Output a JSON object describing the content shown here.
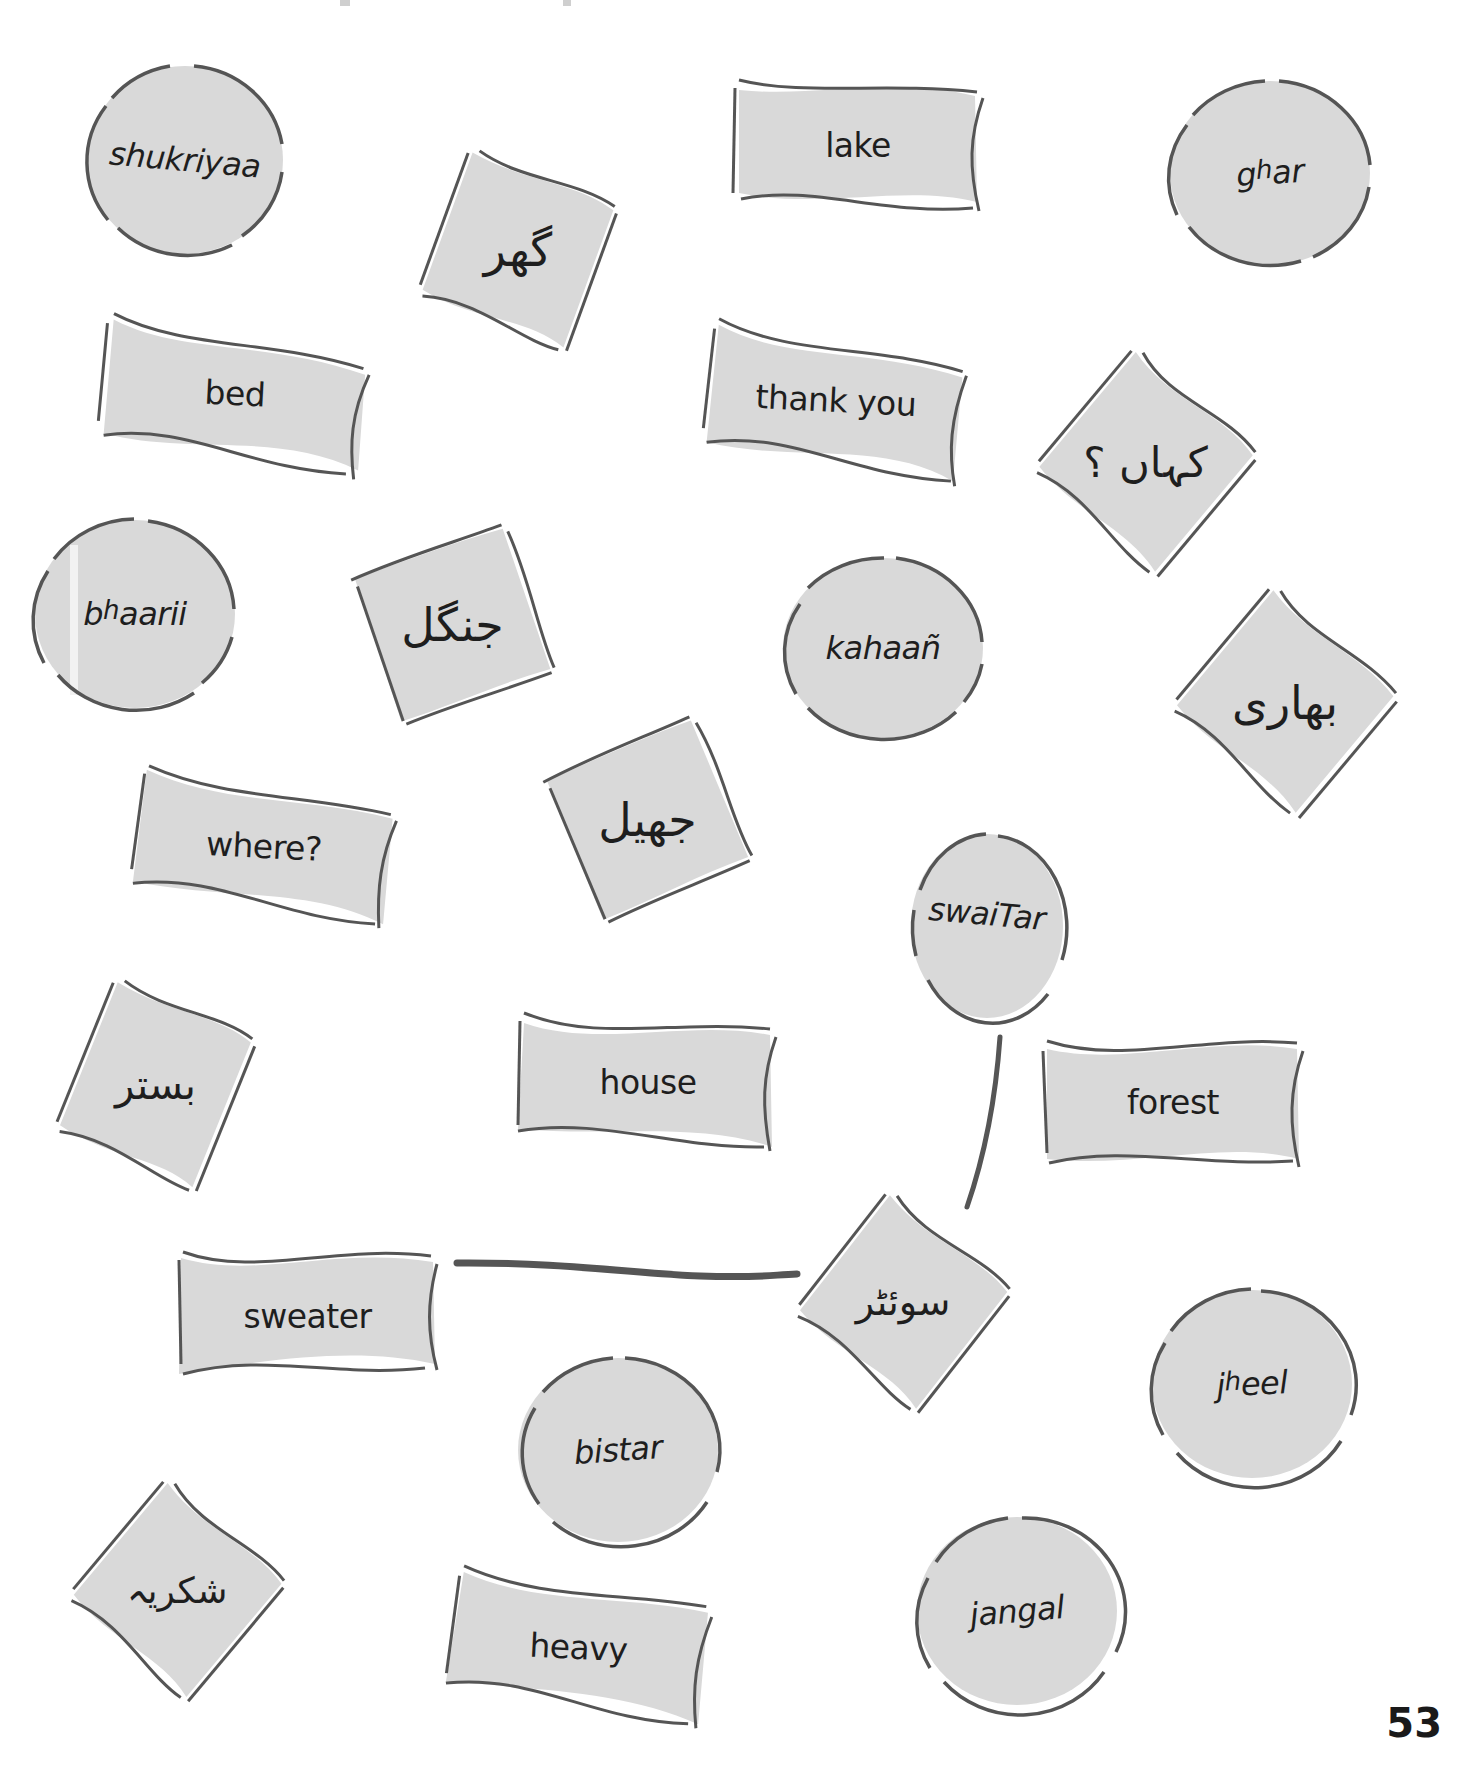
{
  "page": {
    "number": "53"
  },
  "colors": {
    "card_fill": "#d9d9d9",
    "card_stroke": "#555555",
    "text": "#1e1e1e",
    "background": "#ffffff"
  },
  "cards": {
    "english": [
      {
        "id": "lake",
        "label": "lake"
      },
      {
        "id": "bed",
        "label": "bed"
      },
      {
        "id": "thank_you",
        "label": "thank you"
      },
      {
        "id": "where",
        "label": "where?"
      },
      {
        "id": "house",
        "label": "house"
      },
      {
        "id": "forest",
        "label": "forest"
      },
      {
        "id": "sweater",
        "label": "sweater"
      },
      {
        "id": "heavy",
        "label": "heavy"
      }
    ],
    "transliteration": [
      {
        "id": "shukriyaa",
        "label": "shukriyaa"
      },
      {
        "id": "ghar",
        "base": "g",
        "sup": "h",
        "rest": "ar"
      },
      {
        "id": "bhaarii",
        "base": "b",
        "sup": "h",
        "rest": "aarii"
      },
      {
        "id": "kahaan",
        "label": "kahaañ"
      },
      {
        "id": "swaiTar",
        "label": "swaiTar"
      },
      {
        "id": "bistar",
        "label": "bistar"
      },
      {
        "id": "jheel",
        "base": "j",
        "sup": "h",
        "rest": "eel"
      },
      {
        "id": "jangal",
        "label": "jangal"
      }
    ],
    "urdu": [
      {
        "id": "ghar",
        "label": "گھر"
      },
      {
        "id": "kahaan",
        "label": "کہاں ؟"
      },
      {
        "id": "jangal",
        "label": "جنگل"
      },
      {
        "id": "bhaarii",
        "label": "بھاری"
      },
      {
        "id": "jheel",
        "label": "جھیل"
      },
      {
        "id": "bistar",
        "label": "بستر"
      },
      {
        "id": "swaiTar",
        "label": "سوئٹر"
      },
      {
        "id": "shukriyaa",
        "label": "شکریہ"
      }
    ]
  },
  "connectors": [
    {
      "from": "sweater",
      "to": "urdu-swaiTar"
    },
    {
      "from": "urdu-swaiTar",
      "to": "swaiTar"
    }
  ]
}
